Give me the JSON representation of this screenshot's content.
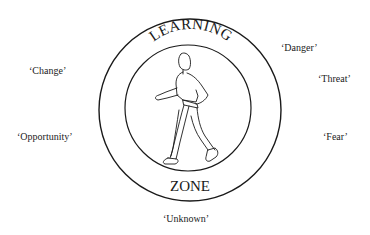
{
  "diagram": {
    "title_top": "LEARNING",
    "title_bottom": "ZONE",
    "center_figure": "walking-person",
    "colors": {
      "stroke": "#1a1a1a",
      "background": "#ffffff"
    },
    "left_labels": [
      {
        "text": "‘Change’"
      },
      {
        "text": "‘Opportunity’"
      }
    ],
    "right_labels": [
      {
        "text": "‘Danger’"
      },
      {
        "text": "‘Threat’"
      },
      {
        "text": "‘Fear’"
      }
    ],
    "bottom_label": {
      "text": "‘Unknown’"
    }
  }
}
